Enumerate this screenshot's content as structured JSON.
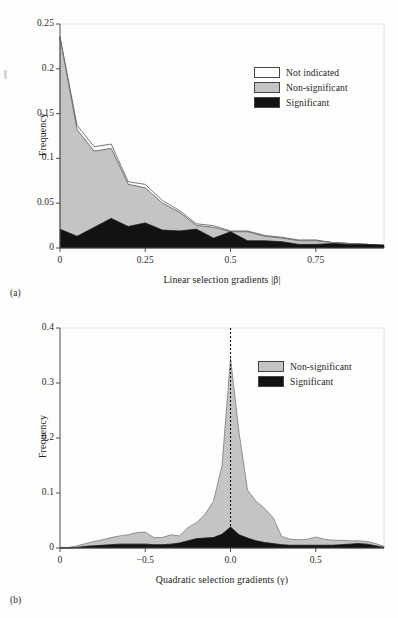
{
  "figure": {
    "panels": [
      {
        "tag": "(a)",
        "ylabel": "Frequency",
        "xlabel": "Linear selection gradients |β|",
        "legend": [
          {
            "label": "Not indicated",
            "color": "#fefefe"
          },
          {
            "label": "Non-significant",
            "color": "#c4c4c4"
          },
          {
            "label": "Significant",
            "color": "#121212"
          }
        ]
      },
      {
        "tag": "(b)",
        "ylabel": "Frequency",
        "xlabel": "Quadratic selection gradients (γ)",
        "legend": [
          {
            "label": "Non-significant",
            "color": "#c4c4c4"
          },
          {
            "label": "Significant",
            "color": "#121212"
          }
        ]
      }
    ]
  },
  "chart_data": [
    {
      "type": "area",
      "stacked": true,
      "title": "",
      "panel": "(a)",
      "xlabel": "Linear selection gradients |β|",
      "ylabel": "Frequency",
      "xlim": [
        0,
        0.95
      ],
      "ylim": [
        0,
        0.25
      ],
      "xticks": [
        0,
        0.25,
        0.5,
        0.75
      ],
      "xticklabels": [
        "0",
        "0.25",
        "0.5",
        "0.75"
      ],
      "yticks": [
        0,
        0.05,
        0.1,
        0.15,
        0.2,
        0.25
      ],
      "yticklabels": [
        "0",
        "0.05",
        "0.1",
        "0.15",
        "0.2",
        "0.25"
      ],
      "grid": false,
      "legend_position": "upper right",
      "x": [
        0.0,
        0.05,
        0.1,
        0.15,
        0.2,
        0.25,
        0.3,
        0.35,
        0.4,
        0.45,
        0.5,
        0.55,
        0.6,
        0.65,
        0.7,
        0.75,
        0.8,
        0.85,
        0.9,
        0.95
      ],
      "series": [
        {
          "name": "Significant",
          "color": "#121212",
          "values": [
            0.021,
            0.013,
            0.023,
            0.033,
            0.024,
            0.028,
            0.02,
            0.019,
            0.021,
            0.011,
            0.018,
            0.008,
            0.008,
            0.007,
            0.004,
            0.004,
            0.005,
            0.004,
            0.004,
            0.003
          ]
        },
        {
          "name": "Non-significant",
          "color": "#c4c4c4",
          "values": [
            0.213,
            0.119,
            0.085,
            0.078,
            0.047,
            0.039,
            0.03,
            0.021,
            0.004,
            0.012,
            0.0,
            0.01,
            0.005,
            0.004,
            0.004,
            0.004,
            0.001,
            0.001,
            0.0,
            0.0
          ]
        },
        {
          "name": "Not indicated",
          "color": "#fefefe",
          "values": [
            0.002,
            0.005,
            0.005,
            0.005,
            0.003,
            0.004,
            0.003,
            0.002,
            0.002,
            0.002,
            0.001,
            0.001,
            0.001,
            0.001,
            0.001,
            0.001,
            0.0,
            0.0,
            0.0,
            0.0
          ]
        }
      ],
      "totals": [
        0.236,
        0.137,
        0.113,
        0.116,
        0.074,
        0.071,
        0.053,
        0.042,
        0.027,
        0.025,
        0.019,
        0.019,
        0.014,
        0.012,
        0.009,
        0.009,
        0.006,
        0.005,
        0.004,
        0.003
      ]
    },
    {
      "type": "area",
      "stacked": true,
      "title": "",
      "panel": "(b)",
      "xlabel": "Quadratic selection gradients (γ)",
      "ylabel": "Frequency",
      "xlim": [
        -1.0,
        0.9
      ],
      "ylim": [
        0,
        0.4
      ],
      "xticks": [
        -1.0,
        -0.5,
        0.0,
        0.5
      ],
      "xticklabels": [
        "0",
        "−0.5",
        "0.0",
        "0.5"
      ],
      "yticks": [
        0,
        0.1,
        0.2,
        0.3,
        0.4
      ],
      "yticklabels": [
        "0",
        "0.1",
        "0.2",
        "0.3",
        "0.4"
      ],
      "grid": false,
      "legend_position": "upper right",
      "reference_line": {
        "x": 0.0,
        "style": "dotted"
      },
      "x": [
        -1.0,
        -0.95,
        -0.9,
        -0.85,
        -0.8,
        -0.75,
        -0.7,
        -0.65,
        -0.6,
        -0.55,
        -0.5,
        -0.45,
        -0.4,
        -0.35,
        -0.3,
        -0.25,
        -0.2,
        -0.15,
        -0.1,
        -0.05,
        0.0,
        0.05,
        0.1,
        0.15,
        0.2,
        0.25,
        0.3,
        0.35,
        0.4,
        0.45,
        0.5,
        0.55,
        0.6,
        0.65,
        0.7,
        0.75,
        0.8,
        0.85,
        0.9
      ],
      "series": [
        {
          "name": "Significant",
          "color": "#121212",
          "values": [
            0.0,
            0.0,
            0.001,
            0.003,
            0.004,
            0.005,
            0.006,
            0.007,
            0.007,
            0.007,
            0.007,
            0.006,
            0.006,
            0.007,
            0.009,
            0.013,
            0.017,
            0.018,
            0.019,
            0.025,
            0.038,
            0.024,
            0.018,
            0.013,
            0.01,
            0.008,
            0.006,
            0.005,
            0.005,
            0.005,
            0.005,
            0.005,
            0.005,
            0.006,
            0.007,
            0.008,
            0.007,
            0.004,
            0.001
          ]
        },
        {
          "name": "Non-significant",
          "color": "#c4c4c4",
          "values": [
            0.001,
            0.001,
            0.003,
            0.005,
            0.008,
            0.01,
            0.013,
            0.015,
            0.017,
            0.021,
            0.022,
            0.013,
            0.013,
            0.017,
            0.013,
            0.024,
            0.029,
            0.043,
            0.066,
            0.125,
            0.307,
            0.186,
            0.087,
            0.072,
            0.062,
            0.047,
            0.015,
            0.011,
            0.01,
            0.011,
            0.015,
            0.011,
            0.009,
            0.008,
            0.006,
            0.005,
            0.005,
            0.004,
            0.002
          ]
        }
      ],
      "totals": [
        0.001,
        0.001,
        0.004,
        0.008,
        0.012,
        0.015,
        0.019,
        0.022,
        0.024,
        0.028,
        0.029,
        0.019,
        0.019,
        0.024,
        0.022,
        0.037,
        0.046,
        0.061,
        0.085,
        0.15,
        0.345,
        0.21,
        0.105,
        0.085,
        0.072,
        0.055,
        0.021,
        0.016,
        0.015,
        0.016,
        0.02,
        0.016,
        0.014,
        0.014,
        0.013,
        0.013,
        0.012,
        0.008,
        0.003
      ]
    }
  ]
}
